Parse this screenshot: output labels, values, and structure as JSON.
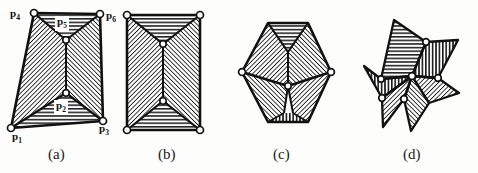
{
  "figure": {
    "background_color": "#fdfdfb",
    "ink_color": "#111111",
    "hatch_color": "#1a1a1a",
    "vertex_fill": "#ffffff"
  },
  "captions": [
    {
      "id": "caption-a",
      "label": "(a)",
      "x": 48,
      "y": 146
    },
    {
      "id": "caption-b",
      "label": "(b)",
      "x": 158,
      "y": 146
    },
    {
      "id": "caption-c",
      "label": "(c)",
      "x": 273,
      "y": 146
    },
    {
      "id": "caption-d",
      "label": "(d)",
      "x": 403,
      "y": 146
    }
  ],
  "vertex_labels": [
    {
      "id": "label-p4",
      "text": "p",
      "sub": "4",
      "x": 10,
      "y": 7,
      "boxed": false
    },
    {
      "id": "label-p5",
      "text": "p",
      "sub": "5",
      "x": 55,
      "y": 17,
      "boxed": true
    },
    {
      "id": "label-p6",
      "text": "p",
      "sub": "6",
      "x": 106,
      "y": 9,
      "boxed": false
    },
    {
      "id": "label-p2",
      "text": "p",
      "sub": "2",
      "x": 54,
      "y": 101,
      "boxed": true
    },
    {
      "id": "label-p3",
      "text": "p",
      "sub": "3",
      "x": 99,
      "y": 122,
      "boxed": false
    },
    {
      "id": "label-p1",
      "text": "p",
      "sub": "1",
      "x": 12,
      "y": 130,
      "boxed": false
    }
  ],
  "panels": {
    "a": {
      "name": "quadrilateral-with-two-notches",
      "outline": [
        [
          34,
          13
        ],
        [
          100,
          14
        ],
        [
          103,
          121
        ],
        [
          11,
          128
        ]
      ],
      "interior_vertices": [
        [
          66,
          40
        ],
        [
          66,
          93
        ]
      ],
      "regions": [
        {
          "name": "region-top-horizontal",
          "fill": "horizontal",
          "points": [
            [
              34,
              13
            ],
            [
              100,
              14
            ],
            [
              66,
              40
            ]
          ]
        },
        {
          "name": "region-left-diagonal",
          "fill": "diagonal",
          "points": [
            [
              34,
              13
            ],
            [
              66,
              40
            ],
            [
              66,
              93
            ],
            [
              11,
              128
            ]
          ]
        },
        {
          "name": "region-right-diagonal",
          "fill": "diagonal",
          "points": [
            [
              100,
              14
            ],
            [
              103,
              121
            ],
            [
              66,
              93
            ],
            [
              66,
              40
            ]
          ]
        },
        {
          "name": "region-bottom-horizontal",
          "fill": "horizontal",
          "points": [
            [
              11,
              128
            ],
            [
              66,
              93
            ],
            [
              103,
              121
            ]
          ]
        }
      ]
    },
    "b": {
      "name": "rectangle-with-two-notches",
      "outline": [
        [
          127,
          15
        ],
        [
          200,
          15
        ],
        [
          200,
          130
        ],
        [
          127,
          130
        ]
      ],
      "interior_vertices": [
        [
          163,
          44
        ],
        [
          163,
          101
        ]
      ],
      "regions": [
        {
          "name": "region-top-horizontal",
          "fill": "horizontal",
          "points": [
            [
              127,
              15
            ],
            [
              200,
              15
            ],
            [
              163,
              44
            ]
          ]
        },
        {
          "name": "region-left-diagonal",
          "fill": "diagonal",
          "points": [
            [
              127,
              15
            ],
            [
              163,
              44
            ],
            [
              163,
              101
            ],
            [
              127,
              130
            ]
          ]
        },
        {
          "name": "region-right-diagonal",
          "fill": "diagonal",
          "points": [
            [
              200,
              15
            ],
            [
              200,
              130
            ],
            [
              163,
              101
            ],
            [
              163,
              44
            ]
          ]
        },
        {
          "name": "region-bottom-horizontal",
          "fill": "horizontal",
          "points": [
            [
              127,
              130
            ],
            [
              163,
              101
            ],
            [
              200,
              130
            ]
          ]
        }
      ]
    },
    "c": {
      "name": "hexagon-decomposition",
      "outline": [
        [
          268,
          23
        ],
        [
          308,
          23
        ],
        [
          331,
          72
        ],
        [
          308,
          122
        ],
        [
          268,
          122
        ],
        [
          242,
          72
        ]
      ],
      "interior_vertices": [
        [
          288,
          52
        ],
        [
          288,
          86
        ]
      ],
      "regions": [
        {
          "name": "region-top-horizontal",
          "fill": "horizontal",
          "points": [
            [
              268,
              23
            ],
            [
              308,
              23
            ],
            [
              288,
              52
            ]
          ]
        },
        {
          "name": "region-upper-left-diagonal",
          "fill": "diagonal",
          "points": [
            [
              268,
              23
            ],
            [
              288,
              52
            ],
            [
              288,
              86
            ],
            [
              242,
              72
            ]
          ]
        },
        {
          "name": "region-upper-right-diagonal",
          "fill": "diagonal",
          "points": [
            [
              308,
              23
            ],
            [
              331,
              72
            ],
            [
              288,
              86
            ],
            [
              288,
              52
            ]
          ]
        },
        {
          "name": "region-lower-left-diagonal",
          "fill": "diagonal",
          "points": [
            [
              242,
              72
            ],
            [
              288,
              86
            ],
            [
              284,
              112
            ],
            [
              268,
              122
            ]
          ]
        },
        {
          "name": "region-lower-right-diagonal",
          "fill": "diagonal",
          "points": [
            [
              331,
              72
            ],
            [
              308,
              122
            ],
            [
              292,
              112
            ],
            [
              288,
              86
            ]
          ]
        },
        {
          "name": "region-bottom-vertical",
          "fill": "vertical",
          "points": [
            [
              268,
              122
            ],
            [
              284,
              112
            ],
            [
              292,
              112
            ],
            [
              308,
              122
            ]
          ]
        }
      ]
    },
    "d": {
      "name": "five-point-star-decomposition",
      "center": [
        412,
        76
      ],
      "outer_points": [
        [
          394,
          20
        ],
        [
          455,
          40
        ],
        [
          458,
          93
        ],
        [
          411,
          130
        ],
        [
          365,
          65
        ]
      ],
      "inner_vertices": [
        [
          425,
          41
        ],
        [
          437,
          78
        ],
        [
          404,
          99
        ],
        [
          381,
          79
        ],
        [
          393,
          47
        ]
      ],
      "regions": [
        {
          "name": "star-arm-top",
          "fill": "horizontal"
        },
        {
          "name": "star-arm-upper-right",
          "fill": "vertical"
        },
        {
          "name": "star-arm-lower-right",
          "fill": "diagonal"
        },
        {
          "name": "star-arm-lower-left",
          "fill": "diagonal"
        },
        {
          "name": "star-arm-left",
          "fill": "vertical"
        }
      ]
    }
  }
}
